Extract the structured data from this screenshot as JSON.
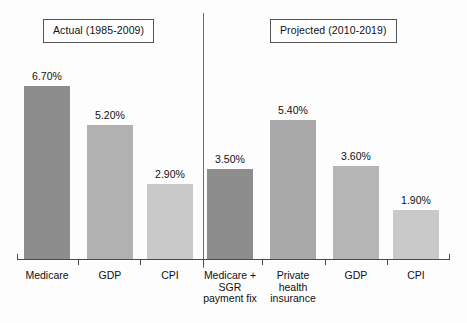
{
  "chart_data": {
    "type": "bar",
    "title": "",
    "subtitle": "",
    "xlabel": "",
    "ylabel": "",
    "ylim": [
      0,
      7.5
    ],
    "grid": false,
    "legend": false,
    "value_format": "percent_two_decimals",
    "panels": [
      {
        "id": "actual",
        "header": "Actual (1985-2009)",
        "categories": [
          "Medicare",
          "GDP",
          "CPI"
        ],
        "values": [
          6.7,
          5.2,
          2.9
        ],
        "value_labels": [
          "6.70%",
          "5.20%",
          "2.90%"
        ],
        "colors": [
          "#8d8d8d",
          "#b1b1b1",
          "#c9c9c9"
        ]
      },
      {
        "id": "projected",
        "header": "Projected (2010-2019)",
        "categories": [
          "Medicare +\nSGR\npayment fix",
          "Private\nhealth\ninsurance",
          "GDP",
          "CPI"
        ],
        "values": [
          3.5,
          5.4,
          3.6,
          1.9
        ],
        "value_labels": [
          "3.50%",
          "5.40%",
          "3.60%",
          "1.90%"
        ],
        "colors": [
          "#8d8d8d",
          "#a9a9a9",
          "#b5b5b5",
          "#c9c9c9"
        ]
      }
    ],
    "series": [
      {
        "name": "Average annual growth rate",
        "categories": [
          "Medicare (Actual 1985-2009)",
          "GDP (Actual 1985-2009)",
          "CPI (Actual 1985-2009)",
          "Medicare + SGR payment fix (Projected 2010-2019)",
          "Private health insurance (Projected 2010-2019)",
          "GDP (Projected 2010-2019)",
          "CPI (Projected 2010-2019)"
        ],
        "values": [
          6.7,
          5.2,
          2.9,
          3.5,
          5.4,
          3.6,
          1.9
        ]
      }
    ]
  },
  "style": {
    "bar_dark": "#8d8d8d",
    "bar_mid": "#b1b1b1",
    "bar_light": "#c9c9c9",
    "axis_color": "#4a4a4a",
    "divider_color": "#6b6b6b",
    "text_color": "#111111",
    "background": "#fdfdfd"
  }
}
